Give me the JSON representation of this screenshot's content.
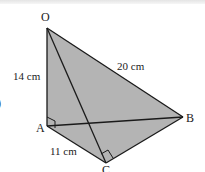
{
  "diagram": {
    "type": "tetrahedron",
    "colors": {
      "face_fill": "#b4b4b4",
      "edge": "#1a1a1a",
      "text": "#222222",
      "background": "#ffffff"
    },
    "vertices": {
      "O": {
        "label": "O",
        "x": 47,
        "y": 28
      },
      "A": {
        "label": "A",
        "x": 47,
        "y": 126
      },
      "B": {
        "label": "B",
        "x": 183,
        "y": 117
      },
      "C": {
        "label": "C",
        "x": 106,
        "y": 163
      }
    },
    "edges": [
      {
        "from": "O",
        "to": "A",
        "length_label": "14 cm"
      },
      {
        "from": "O",
        "to": "B",
        "length_label": "20 cm"
      },
      {
        "from": "A",
        "to": "C",
        "length_label": "11 cm"
      },
      {
        "from": "O",
        "to": "C",
        "length_label": ""
      },
      {
        "from": "A",
        "to": "B",
        "length_label": ""
      },
      {
        "from": "C",
        "to": "B",
        "length_label": ""
      }
    ],
    "right_angles": [
      "A",
      "C"
    ],
    "labels": {
      "OA": "14 cm",
      "OB": "20 cm",
      "AC": "11 cm",
      "vertex_O": "O",
      "vertex_A": "A",
      "vertex_B": "B",
      "vertex_C": "C"
    },
    "margin_glyph": ")"
  }
}
